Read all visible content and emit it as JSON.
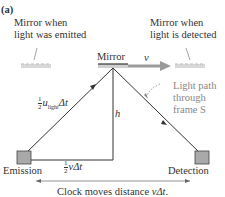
{
  "panel_label": "(a)",
  "labels": {
    "mirror_emitted": [
      "Mirror when",
      "light was emitted"
    ],
    "mirror_detected": [
      "Mirror when",
      "light is detected"
    ],
    "mirror": "Mirror",
    "velocity": "v",
    "light_path": [
      "Light path",
      "through",
      "frame S"
    ],
    "height": "h",
    "hyp_frac_num": "1",
    "hyp_frac_den": "2",
    "hyp_u": "u",
    "hyp_sub": "light",
    "hyp_dt": "Δt",
    "base_frac_num": "1",
    "base_frac_den": "2",
    "base_v": "v",
    "base_dt": "Δt",
    "emission": "Emission",
    "detection": "Detection",
    "clock_text": "Clock moves distance ",
    "clock_v": "vΔt",
    "clock_end": "."
  },
  "colors": {
    "line": "#333333",
    "arrow_gray": "#9a9a9a",
    "box_fill": "#a9a9a9",
    "mirror_ghost": "#bbbbbb"
  }
}
